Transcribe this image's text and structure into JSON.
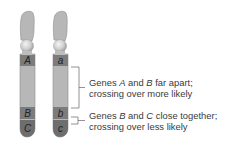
{
  "diagram": {
    "chromosomes": [
      {
        "id": "left",
        "genes": [
          "A",
          "B",
          "C"
        ]
      },
      {
        "id": "right",
        "genes": [
          "a",
          "b",
          "c"
        ]
      }
    ],
    "annotations": [
      {
        "id": "ab",
        "line1_pre": "Genes ",
        "gene1": "A",
        "line1_mid": " and ",
        "gene2": "B",
        "line1_post": " far apart;",
        "line2": "crossing over more likely"
      },
      {
        "id": "bc",
        "line1_pre": "Genes ",
        "gene1": "B",
        "line1_mid": " and ",
        "gene2": "C",
        "line1_post": " close together;",
        "line2": "crossing over less likely"
      }
    ],
    "colors": {
      "arm": "#b5b5b5",
      "arm_outline": "#8f8f8f",
      "band": "#7a7a7a",
      "centromere": "#d6d6d6",
      "bracket": "#777777",
      "text": "#3a3a3a"
    }
  }
}
